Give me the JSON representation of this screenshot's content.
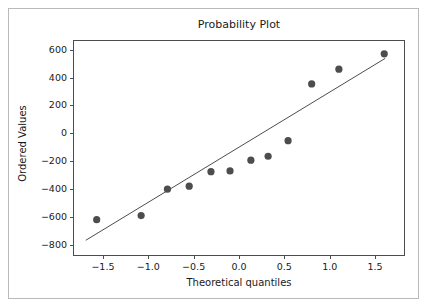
{
  "chart_data": {
    "type": "scatter",
    "title": "Probability Plot",
    "xlabel": "Theoretical quantiles",
    "ylabel": "Ordered Values",
    "xlim": [
      -1.83,
      1.83
    ],
    "ylim": [
      -880,
      670
    ],
    "grid": false,
    "legend": null,
    "xticks": [
      -1.5,
      -1.0,
      -0.5,
      0.0,
      0.5,
      1.0,
      1.5
    ],
    "xtick_labels": [
      "−1.5",
      "−1.0",
      "−0.5",
      "0.0",
      "0.5",
      "1.0",
      "1.5"
    ],
    "yticks": [
      600,
      400,
      200,
      0,
      -200,
      -400,
      -600,
      -800
    ],
    "ytick_labels": [
      "600",
      "400",
      "200",
      "0",
      "−200",
      "−400",
      "−600",
      "−800"
    ],
    "series": [
      {
        "name": "Ordered Values",
        "type": "scatter",
        "marker": "circle",
        "color": "#4d4d4d",
        "marker_size": 6,
        "x": [
          -1.58,
          -1.09,
          -0.8,
          -0.56,
          -0.32,
          -0.11,
          0.12,
          0.31,
          0.53,
          0.79,
          1.09,
          1.59
        ],
        "y": [
          -612,
          -583,
          -393,
          -372,
          -268,
          -262,
          -185,
          -157,
          -45,
          362,
          468,
          578
        ]
      },
      {
        "name": "fit-line",
        "type": "line",
        "color": "#4d4d4d",
        "linewidth": 1,
        "x": [
          -1.7,
          1.6
        ],
        "y": [
          -760,
          545
        ]
      }
    ]
  },
  "figure": {
    "title": "Probability Plot",
    "xaxis_title": "Theoretical quantiles",
    "yaxis_title": "Ordered Values"
  }
}
